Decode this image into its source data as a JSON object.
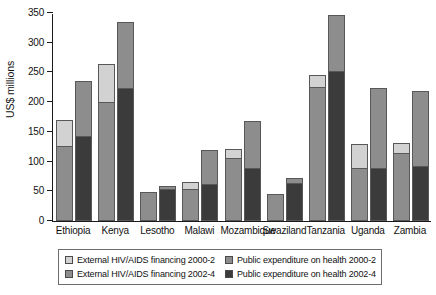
{
  "chart_data": {
    "type": "bar",
    "subtype": "grouped-stacked",
    "title": "",
    "xlabel": "",
    "ylabel": "US$ millions",
    "ylim": [
      0,
      350
    ],
    "ytick_step": 50,
    "yticks": [
      0,
      50,
      100,
      150,
      200,
      250,
      300,
      350
    ],
    "grid": false,
    "legend_position": "bottom",
    "categories": [
      "Ethiopia",
      "Kenya",
      "Lesotho",
      "Malawi",
      "Mozambique",
      "Swaziland",
      "Tanzania",
      "Uganda",
      "Zambia"
    ],
    "series": [
      {
        "name": "Public expenditure on health 2000-2",
        "period": "2000-2",
        "stack": "bar-left",
        "color": "#8d8d8d",
        "values": [
          125,
          200,
          48,
          54,
          105,
          46,
          225,
          89,
          114
        ]
      },
      {
        "name": "External HIV/AIDS financing 2000-2",
        "period": "2000-2",
        "stack": "bar-left",
        "color": "#d2d2d2",
        "values": [
          45,
          65,
          0,
          11,
          17,
          0,
          20,
          41,
          17
        ]
      },
      {
        "name": "Public expenditure on health 2002-4",
        "period": "2002-4",
        "stack": "bar-right",
        "color": "#3b3b3b",
        "values": [
          142,
          223,
          54,
          61,
          87,
          63,
          251,
          87,
          90
        ]
      },
      {
        "name": "External HIV/AIDS financing 2002-4",
        "period": "2002-4",
        "stack": "bar-right",
        "color": "#8d8d8d",
        "values": [
          93,
          112,
          5,
          58,
          81,
          9,
          96,
          136,
          129
        ]
      }
    ],
    "totals": {
      "bar_2000_2": [
        170,
        265,
        48,
        65,
        122,
        46,
        245,
        130,
        131
      ],
      "bar_2002_4": [
        235,
        335,
        59,
        119,
        168,
        72,
        347,
        223,
        219
      ]
    }
  },
  "axis": {
    "y_title": "US$ millions",
    "y_labels": [
      "350",
      "300",
      "250",
      "200",
      "150",
      "100",
      "50",
      "0"
    ]
  },
  "legend": {
    "items": [
      {
        "label": "External HIV/AIDS financing 2000-2",
        "color": "#d2d2d2",
        "icon": "legend-swatch-icon"
      },
      {
        "label": "Public expenditure on health 2000-2",
        "color": "#8d8d8d",
        "icon": "legend-swatch-icon"
      },
      {
        "label": "External HIV/AIDS financing 2002-4",
        "color": "#8d8d8d",
        "icon": "legend-swatch-icon"
      },
      {
        "label": "Public expenditure on health 2002-4",
        "color": "#3b3b3b",
        "icon": "legend-swatch-icon"
      }
    ]
  }
}
